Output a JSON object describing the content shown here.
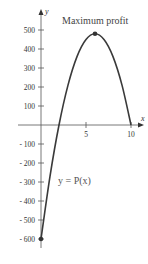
{
  "chart_data": {
    "type": "line",
    "title": "",
    "xlabel": "x",
    "ylabel": "y",
    "xlim": [
      -1.5,
      11
    ],
    "ylim": [
      -650,
      560
    ],
    "x_ticks": [
      5,
      10
    ],
    "x_tick_labels": [
      "5",
      "10"
    ],
    "y_ticks": [
      500,
      400,
      300,
      200,
      100,
      -100,
      -200,
      -300,
      -400,
      -500,
      -600
    ],
    "y_tick_labels": [
      "500",
      "400",
      "300",
      "200",
      "100",
      "- 100",
      "- 200",
      "- 300",
      "- 400",
      "- 500",
      "- 600"
    ],
    "grid": false,
    "series": [
      {
        "name": "y = P(x)",
        "x": [
          0,
          1,
          2,
          3,
          4,
          5,
          6,
          7,
          8,
          9,
          10
        ],
        "y": [
          -600,
          -270,
          0,
          210,
          360,
          450,
          480,
          450,
          360,
          210,
          0
        ]
      }
    ],
    "points": [
      {
        "x": 0,
        "y": -600
      },
      {
        "x": 6,
        "y": 480
      }
    ],
    "annotations": [
      {
        "text": "Maximum profit",
        "x": 6,
        "y": 480
      },
      {
        "text": "y = P(x)",
        "x": 2.8,
        "y": -320
      }
    ]
  }
}
